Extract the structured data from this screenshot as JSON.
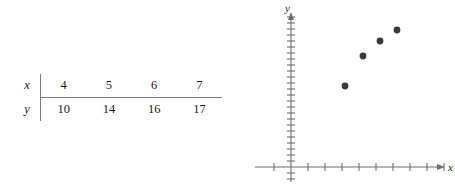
{
  "figure": {
    "background_color": "#ffffff",
    "width": 455,
    "height": 191
  },
  "table": {
    "name": "xy-data-table",
    "row_labels": {
      "x": "x",
      "y": "y"
    },
    "columns": [
      {
        "x": "4",
        "y": "10"
      },
      {
        "x": "5",
        "y": "14"
      },
      {
        "x": "6",
        "y": "16"
      },
      {
        "x": "7",
        "y": "17"
      }
    ],
    "x_values": [
      "4",
      "5",
      "6",
      "7"
    ],
    "y_values": [
      "10",
      "14",
      "16",
      "17"
    ],
    "rule_color": "#7c7c7c",
    "text_color": "#1a1a1a"
  },
  "plot": {
    "x_axis_label": "x",
    "y_axis_label": "y",
    "axis_color": "#6e6e6e",
    "point_color": "#3a3a3c",
    "point_radius": 3.4,
    "origin": {
      "x": 41,
      "y": 167
    },
    "x_tick_spacing": 17,
    "y_tick_spacing": 6,
    "x_ticks_right": 9,
    "x_ticks_left": 1,
    "y_ticks_up": 25,
    "y_ticks_down": 2,
    "x_axis_end": 182,
    "y_axis_top": 16
  },
  "chart_data": {
    "type": "scatter",
    "title": "",
    "xlabel": "x",
    "ylabel": "y",
    "x": [
      4,
      5,
      6,
      7
    ],
    "y": [
      10,
      14,
      16,
      17
    ],
    "points": [
      {
        "x": 4,
        "y": 10,
        "px": 95,
        "py": 86
      },
      {
        "x": 5,
        "y": 14,
        "px": 113,
        "py": 56
      },
      {
        "x": 6,
        "y": 16,
        "px": 130,
        "py": 41
      },
      {
        "x": 7,
        "y": 17,
        "px": 147,
        "py": 30
      }
    ],
    "grid": false,
    "legend": null,
    "xlim": [
      0,
      10
    ],
    "ylim": [
      0,
      25
    ],
    "tick_labels_shown": false
  }
}
